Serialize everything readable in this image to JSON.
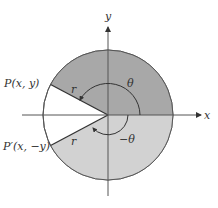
{
  "diagram": {
    "axes": {
      "x_label": "x",
      "y_label": "y"
    },
    "points": {
      "p": "P(x, y)",
      "p_prime": "P′(x, −y)"
    },
    "radius_labels": {
      "upper": "r",
      "lower": "r"
    },
    "angles": {
      "positive": "θ",
      "negative": "−θ"
    },
    "colors": {
      "upper_sector": "#a8a8a8",
      "lower_sector": "#d2d2d2",
      "outline": "#555555",
      "background": "#ffffff"
    }
  }
}
